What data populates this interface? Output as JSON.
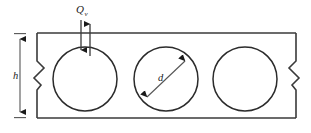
{
  "figure": {
    "background_color": "#ffffff",
    "line_color": "#2b2b2b",
    "dimension_color": "#555555"
  },
  "labels": {
    "shear_force": {
      "symbol": "Q",
      "subscript": "v",
      "name": "shear-force-label"
    },
    "height": {
      "symbol": "h",
      "name": "beam-height-label"
    },
    "diameter": {
      "symbol": "d",
      "name": "opening-diameter-label"
    }
  },
  "beam": {
    "left_x": 37,
    "right_x": 296,
    "top_y": 33,
    "bottom_y": 118,
    "break_symbol_left": true,
    "break_symbol_right": true
  },
  "openings": [
    {
      "name": "opening-1",
      "cx": 85,
      "cy": 79,
      "r": 32
    },
    {
      "name": "opening-2",
      "cx": 166,
      "cy": 79,
      "r": 32
    },
    {
      "name": "opening-3",
      "cx": 245,
      "cy": 79,
      "r": 32
    }
  ],
  "dimensions": [
    {
      "name": "height-dimension",
      "orientation": "vertical",
      "label": "h",
      "x": 20,
      "y_start": 33,
      "y_end": 118,
      "double_headed": true
    },
    {
      "name": "diameter-dimension",
      "orientation": "diagonal",
      "label": "d",
      "x_start": 143,
      "y_start": 101,
      "x_end": 189,
      "y_end": 57,
      "double_headed": true
    }
  ],
  "load_arrows": [
    {
      "name": "shear-arrow-down",
      "x": 81,
      "y_start": 20,
      "y_end": 56,
      "direction": "down"
    },
    {
      "name": "shear-arrow-up",
      "x": 90,
      "y_start": 56,
      "y_end": 18,
      "direction": "up"
    }
  ]
}
